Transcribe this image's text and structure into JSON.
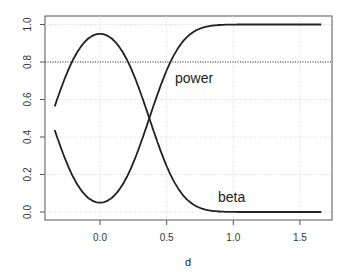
{
  "chart_data": {
    "type": "line",
    "title": "",
    "xlabel": "d",
    "ylabel": "",
    "xlim": [
      -0.34,
      1.67
    ],
    "ylim": [
      0.0,
      1.0
    ],
    "grid": true,
    "legend": "none (inline text labels)",
    "x_ticks": [
      "0.0",
      "0.5",
      "1.0",
      "1.5"
    ],
    "y_ticks": [
      "0.0",
      "0.2",
      "0.4",
      "0.6",
      "0.8",
      "1.0"
    ],
    "reference_line": {
      "y": 0.8,
      "style": "dotted"
    },
    "annotations": [
      {
        "text": "power",
        "x": 0.56,
        "y": 0.69
      },
      {
        "text": "beta",
        "x": 0.89,
        "y": 0.05
      }
    ],
    "x": [
      -0.34,
      -0.3,
      -0.2,
      -0.1,
      0.0,
      0.1,
      0.2,
      0.3,
      0.37,
      0.4,
      0.5,
      0.6,
      0.7,
      0.8,
      0.9,
      1.0,
      1.2,
      1.4,
      1.66
    ],
    "series": [
      {
        "name": "power",
        "values": [
          0.45,
          0.39,
          0.24,
          0.11,
          0.05,
          0.11,
          0.24,
          0.39,
          0.5,
          0.55,
          0.7,
          0.82,
          0.91,
          0.96,
          0.98,
          0.99,
          1.0,
          1.0,
          1.0
        ]
      },
      {
        "name": "beta",
        "values": [
          0.55,
          0.61,
          0.76,
          0.89,
          0.95,
          0.89,
          0.76,
          0.61,
          0.5,
          0.45,
          0.3,
          0.18,
          0.09,
          0.04,
          0.02,
          0.01,
          0.0,
          0.0,
          0.0
        ]
      }
    ]
  }
}
